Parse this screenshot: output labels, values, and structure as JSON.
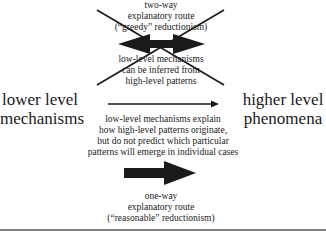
{
  "diagram": {
    "left_node": {
      "line1": "lower level",
      "line2": "mechanisms"
    },
    "right_node": {
      "line1": "higher level",
      "line2": "phenomena"
    },
    "top_route": {
      "status": "crossed-out",
      "label": {
        "line1": "two-way",
        "line2": "explanatory route",
        "line3": "(“greedy” reductionism)"
      },
      "note": {
        "line1": "low-level mechanisms",
        "line2": "can be inferred from",
        "line3": "high-level patterns"
      },
      "arrow": "double-headed"
    },
    "middle_route": {
      "arrow": "thin-right",
      "note": {
        "line1": "low-level mechanisms explain",
        "line2": "how high-level patterns originate,",
        "line3": "but do not predict which particular",
        "line4": "patterns will emerge in individual cases"
      }
    },
    "bottom_route": {
      "arrow": "thick-right",
      "label": {
        "line1": "one-way",
        "line2": "explanatory route",
        "line3": "(“reasonable” reductionism)"
      }
    },
    "colors": {
      "ink": "#1a1a1a",
      "background": "#ffffff",
      "rule": "#555555"
    }
  }
}
